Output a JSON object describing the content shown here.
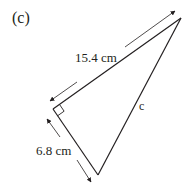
{
  "figure": {
    "part_label": "(c)",
    "shape": "right-angled triangle",
    "sides": {
      "hypotenuse_side_label": "15.4 cm",
      "short_side_label": "6.8 cm",
      "unknown_side_label": "c"
    },
    "right_angle_marker": true,
    "colors": {
      "line": "#231f20",
      "arrow": "#231f20",
      "background": "#ffffff"
    }
  }
}
